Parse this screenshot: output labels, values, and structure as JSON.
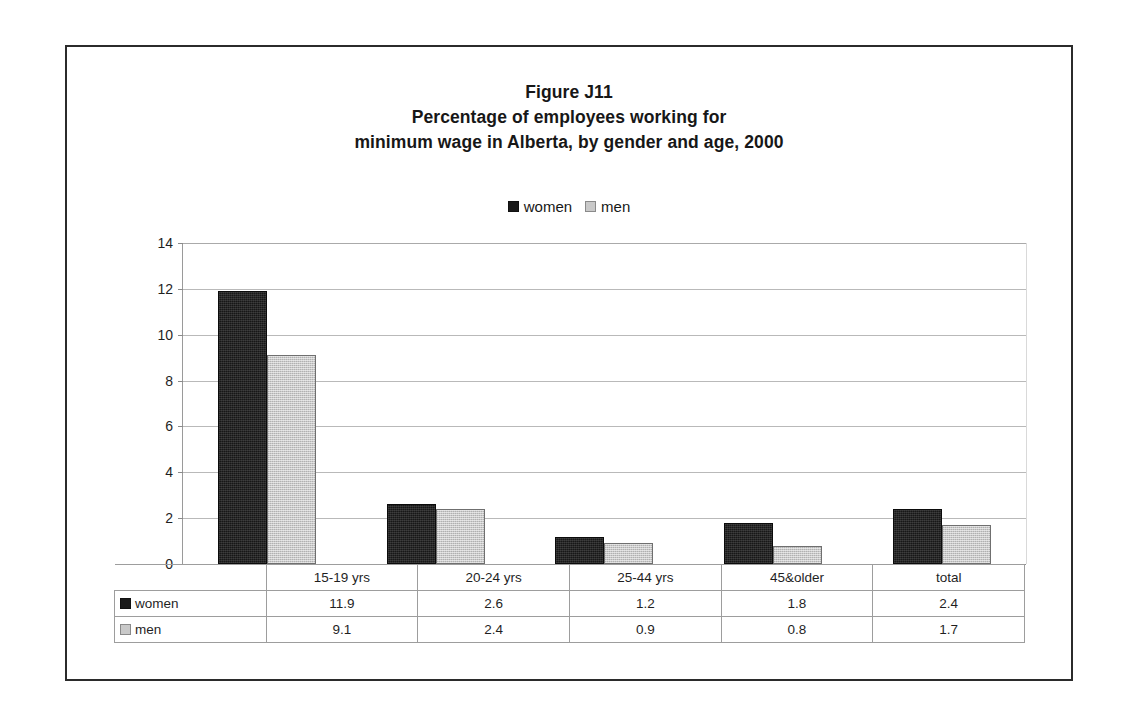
{
  "figure": {
    "title_lines": [
      "Figure J11",
      "Percentage of employees working for",
      "minimum wage in Alberta, by gender and age, 2000"
    ]
  },
  "legend": {
    "items": [
      {
        "label": "women",
        "icon": "square-filled-dark",
        "color": "#1a1a1a"
      },
      {
        "label": "men",
        "icon": "square-filled-light",
        "color": "#c9c9c9"
      }
    ]
  },
  "axis": {
    "y_ticks": [
      "0",
      "2",
      "4",
      "6",
      "8",
      "10",
      "12",
      "14"
    ]
  },
  "table": {
    "column_headers": [
      "15-19 yrs",
      "20-24 yrs",
      "25-44 yrs",
      "45&older",
      "total"
    ],
    "rows": [
      {
        "label": "women",
        "values": [
          "11.9",
          "2.6",
          "1.2",
          "1.8",
          "2.4"
        ]
      },
      {
        "label": "men",
        "values": [
          "9.1",
          "2.4",
          "0.9",
          "0.8",
          "1.7"
        ]
      }
    ]
  },
  "chart_data": {
    "type": "bar",
    "xlabel": "",
    "ylabel": "",
    "ylim": [
      0,
      14
    ],
    "ytick_step": 2,
    "grid": true,
    "legend_position": "top-center",
    "categories": [
      "15-19 yrs",
      "20-24 yrs",
      "25-44 yrs",
      "45&older",
      "total"
    ],
    "series": [
      {
        "name": "women",
        "color": "#1a1a1a",
        "values": [
          11.9,
          2.6,
          1.2,
          1.8,
          2.4
        ]
      },
      {
        "name": "men",
        "color": "#c9c9c9",
        "values": [
          9.1,
          2.4,
          0.9,
          0.8,
          1.7
        ]
      }
    ]
  }
}
